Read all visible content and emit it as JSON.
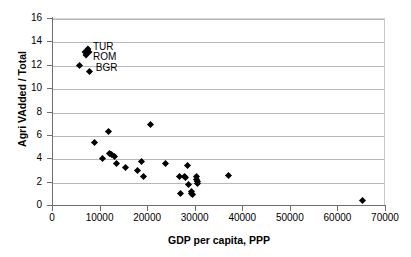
{
  "chart_data": {
    "type": "scatter",
    "title": "",
    "xlabel": "GDP per capita, PPP",
    "ylabel": "Agri VAdded / Total",
    "xlim": [
      0,
      70000
    ],
    "ylim": [
      0,
      16
    ],
    "grid": true,
    "legend": "none",
    "x_ticks": [
      "0",
      "10000",
      "20000",
      "30000",
      "40000",
      "50000",
      "60000",
      "70000"
    ],
    "x_tick_values": [
      0,
      10000,
      20000,
      30000,
      40000,
      50000,
      60000,
      70000
    ],
    "y_ticks": [
      "0",
      "2",
      "4",
      "6",
      "8",
      "10",
      "12",
      "14",
      "16"
    ],
    "y_tick_values": [
      0,
      2,
      4,
      6,
      8,
      10,
      12,
      14,
      16
    ],
    "points": [
      {
        "x": 5700,
        "y": 12.05,
        "shape": "diamond"
      },
      {
        "x": 7300,
        "y": 13.3,
        "shape": "tall-diamond"
      },
      {
        "x": 7400,
        "y": 13.05,
        "shape": "tall-diamond"
      },
      {
        "x": 7900,
        "y": 11.55,
        "shape": "diamond"
      },
      {
        "x": 9000,
        "y": 5.45,
        "shape": "diamond"
      },
      {
        "x": 10600,
        "y": 4.1,
        "shape": "diamond"
      },
      {
        "x": 11900,
        "y": 6.4,
        "shape": "diamond"
      },
      {
        "x": 12100,
        "y": 4.45,
        "shape": "diamond"
      },
      {
        "x": 12500,
        "y": 4.4,
        "shape": "diamond"
      },
      {
        "x": 13100,
        "y": 4.2,
        "shape": "diamond"
      },
      {
        "x": 13500,
        "y": 3.6,
        "shape": "diamond"
      },
      {
        "x": 15400,
        "y": 3.3,
        "shape": "diamond"
      },
      {
        "x": 17900,
        "y": 3.05,
        "shape": "diamond"
      },
      {
        "x": 18900,
        "y": 3.85,
        "shape": "diamond"
      },
      {
        "x": 19300,
        "y": 2.5,
        "shape": "diamond"
      },
      {
        "x": 20700,
        "y": 6.95,
        "shape": "diamond"
      },
      {
        "x": 23900,
        "y": 3.65,
        "shape": "diamond"
      },
      {
        "x": 26900,
        "y": 2.5,
        "shape": "diamond"
      },
      {
        "x": 27100,
        "y": 1.1,
        "shape": "diamond"
      },
      {
        "x": 27900,
        "y": 2.5,
        "shape": "diamond"
      },
      {
        "x": 28100,
        "y": 2.45,
        "shape": "diamond"
      },
      {
        "x": 28500,
        "y": 3.45,
        "shape": "diamond"
      },
      {
        "x": 28600,
        "y": 1.8,
        "shape": "diamond"
      },
      {
        "x": 29300,
        "y": 1.25,
        "shape": "diamond"
      },
      {
        "x": 29400,
        "y": 1.05,
        "shape": "diamond"
      },
      {
        "x": 29500,
        "y": 0.95,
        "shape": "diamond"
      },
      {
        "x": 30300,
        "y": 2.5,
        "shape": "diamond"
      },
      {
        "x": 30400,
        "y": 2.3,
        "shape": "diamond"
      },
      {
        "x": 30500,
        "y": 2.1,
        "shape": "diamond"
      },
      {
        "x": 30600,
        "y": 1.9,
        "shape": "diamond"
      },
      {
        "x": 37000,
        "y": 2.6,
        "shape": "diamond"
      },
      {
        "x": 65300,
        "y": 0.5,
        "shape": "diamond"
      }
    ],
    "annotations": [
      {
        "text": "TUR",
        "x": 8600,
        "y": 13.55
      },
      {
        "text": "ROM",
        "x": 8600,
        "y": 12.7
      },
      {
        "text": "BGR",
        "x": 9200,
        "y": 11.7
      }
    ]
  }
}
